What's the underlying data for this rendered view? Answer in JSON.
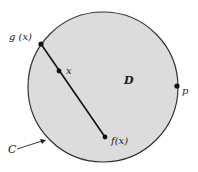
{
  "diagram": {
    "region_label": "D",
    "boundary_label": "C",
    "points": {
      "g": {
        "label": "g (x)",
        "x": 41,
        "y": 44
      },
      "x": {
        "label": "x",
        "x": 59,
        "y": 71
      },
      "f": {
        "label": "f(x)",
        "x": 105,
        "y": 137
      },
      "p": {
        "label": "p",
        "x": 177,
        "y": 86
      }
    },
    "circle": {
      "cx": 103,
      "cy": 87,
      "r": 75,
      "fill": "#dcdcdc",
      "stroke": "#333333"
    }
  }
}
